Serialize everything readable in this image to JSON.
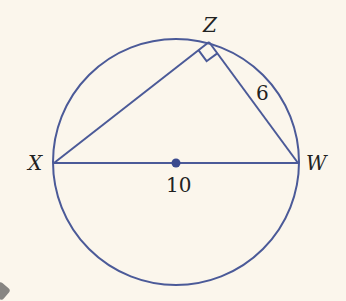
{
  "diagram": {
    "background": "#fbf6ec",
    "stroke_color": "#4b5a98",
    "points": {
      "X": {
        "label": "X",
        "x": 54,
        "y": 163
      },
      "Z": {
        "label": "Z",
        "x": 209,
        "y": 42
      },
      "W": {
        "label": "W",
        "x": 298,
        "y": 163
      },
      "center": {
        "x": 176,
        "y": 163
      }
    },
    "labels": {
      "X": "X",
      "Z": "Z",
      "W": "W",
      "side_ZW": "6",
      "diameter_XW": "10"
    },
    "right_angle_at": "Z"
  }
}
